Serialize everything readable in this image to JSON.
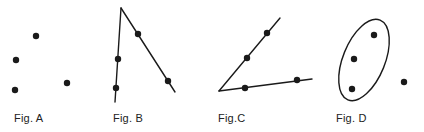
{
  "style": {
    "ink": "#1a1a1a",
    "background": "#ffffff",
    "point_radius": 3.2,
    "stroke_width": 1.4
  },
  "figures": [
    {
      "label": "Fig. A",
      "label_pos": [
        14,
        112
      ],
      "points": [
        [
          36,
          36
        ],
        [
          16,
          60
        ],
        [
          15,
          90
        ],
        [
          67,
          83
        ]
      ],
      "lines": [],
      "ellipse": null
    },
    {
      "label": "Fig. B",
      "label_pos": [
        113,
        112
      ],
      "points": [
        [
          138,
          34
        ],
        [
          118,
          59
        ],
        [
          116,
          88
        ],
        [
          168,
          81
        ]
      ],
      "lines": [
        [
          [
            121,
            8
          ],
          [
            115,
            102
          ]
        ],
        [
          [
            121,
            8
          ],
          [
            175,
            92
          ]
        ]
      ],
      "ellipse": null
    },
    {
      "label": "Fig.C",
      "label_pos": [
        218,
        112
      ],
      "points": [
        [
          267,
          33
        ],
        [
          247,
          58
        ],
        [
          245,
          88
        ],
        [
          297,
          80
        ]
      ],
      "lines": [
        [
          [
            219,
            91
          ],
          [
            280,
            18
          ]
        ],
        [
          [
            219,
            91
          ],
          [
            312,
            79
          ]
        ]
      ],
      "ellipse": null
    },
    {
      "label": "Fig. D",
      "label_pos": [
        336,
        112
      ],
      "points": [
        [
          374,
          35
        ],
        [
          354,
          59
        ],
        [
          352,
          89
        ],
        [
          404,
          82
        ]
      ],
      "lines": [],
      "ellipse": {
        "cx": 364,
        "cy": 60,
        "rx": 21,
        "ry": 43,
        "rotate": 22
      }
    }
  ]
}
